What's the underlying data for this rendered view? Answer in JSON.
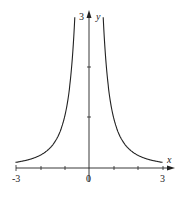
{
  "chart_data": {
    "type": "line",
    "title": "",
    "function": "y = 1/x^2",
    "xlabel": "x",
    "ylabel": "y",
    "xlim": [
      -3,
      3
    ],
    "ylim": [
      0,
      3
    ],
    "x_tick_labels": [
      "-3",
      "0",
      "3"
    ],
    "y_tick_labels": [
      "3"
    ],
    "grid": false,
    "series": [
      {
        "name": "left branch",
        "x": [
          -3,
          -2.5,
          -2,
          -1.5,
          -1,
          -0.8,
          -0.7,
          -0.58
        ],
        "y": [
          0.11,
          0.16,
          0.25,
          0.44,
          1,
          1.56,
          2.04,
          3
        ]
      },
      {
        "name": "right branch",
        "x": [
          0.58,
          0.7,
          0.8,
          1,
          1.5,
          2,
          2.5,
          3
        ],
        "y": [
          3,
          2.04,
          1.56,
          1,
          0.44,
          0.25,
          0.16,
          0.11
        ]
      }
    ]
  },
  "labels": {
    "x_axis": "x",
    "y_axis": "y",
    "x_min": "-3",
    "origin": "0",
    "x_max": "3",
    "y_max": "3"
  }
}
